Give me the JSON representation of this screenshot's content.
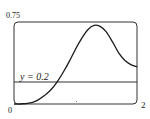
{
  "chart_data": {
    "type": "line",
    "title": "",
    "xlabel": "",
    "ylabel": "",
    "xlim": [
      0,
      2
    ],
    "ylim": [
      0,
      0.75
    ],
    "tick_labels": {
      "y_top": "0.75",
      "origin": "0",
      "x_right": "2"
    },
    "grid": false,
    "series": [
      {
        "name": "f(x)",
        "x": [
          0,
          0.1,
          0.2,
          0.3,
          0.4,
          0.5,
          0.6,
          0.7,
          0.8,
          0.9,
          1.0,
          1.1,
          1.2,
          1.3,
          1.4,
          1.5,
          1.6,
          1.7,
          1.8,
          1.9,
          2.0
        ],
        "values": [
          0,
          0.0,
          0.005,
          0.015,
          0.04,
          0.08,
          0.13,
          0.2,
          0.29,
          0.39,
          0.5,
          0.6,
          0.68,
          0.72,
          0.71,
          0.66,
          0.57,
          0.47,
          0.4,
          0.36,
          0.34
        ]
      },
      {
        "name": "y = 0.2",
        "x": [
          0,
          2
        ],
        "values": [
          0.2,
          0.2
        ]
      }
    ],
    "annotations": [
      {
        "text": "y = 0.2",
        "x": 0.15,
        "y": 0.2
      }
    ]
  }
}
